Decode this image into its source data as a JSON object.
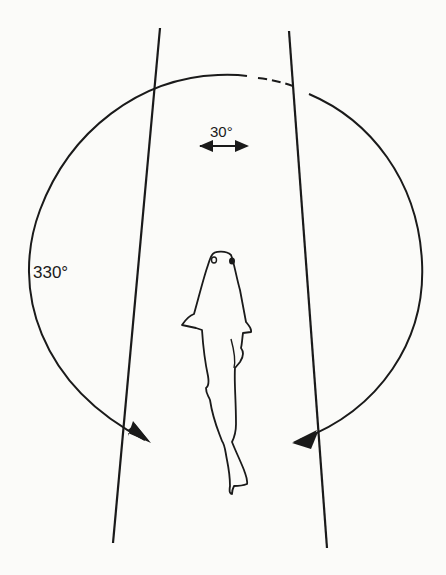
{
  "figure": {
    "labels": {
      "binocular_angle": "30°",
      "visual_field_angle": "330°"
    },
    "colors": {
      "ink": "#1a1a1a",
      "background": "#fbfbf9"
    }
  }
}
